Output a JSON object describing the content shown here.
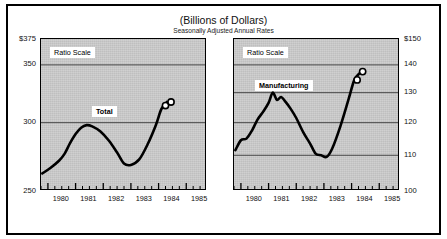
{
  "figure": {
    "title": "(Billions of Dollars)",
    "subtitle": "Seasonally Adjusted Annual Rates"
  },
  "chart_data": [
    {
      "type": "line",
      "panel": "left",
      "title": "Total",
      "series_label": "Total",
      "scale_note": "Ratio Scale",
      "xlabel": "",
      "ylabel": "",
      "yaxis_side": "left",
      "ylim": [
        250,
        375
      ],
      "ytick_labels": [
        "$375",
        "350",
        "300",
        "250"
      ],
      "ytick_values": [
        375,
        350,
        300,
        250
      ],
      "grid": true,
      "xlim": [
        1979.75,
        1985.75
      ],
      "xtick_labels": [
        "1980",
        "1981",
        "1982",
        "1983",
        "1984",
        "1985"
      ],
      "xtick_values": [
        1980,
        1981,
        1982,
        1983,
        1984,
        1985
      ],
      "minor_ticks_per_year": 4,
      "x": [
        1979.8,
        1980.1,
        1980.4,
        1980.6,
        1980.8,
        1981.0,
        1981.2,
        1981.4,
        1981.6,
        1981.9,
        1982.2,
        1982.5,
        1982.75,
        1983.0,
        1983.3,
        1983.6,
        1983.9,
        1984.1,
        1984.3
      ],
      "values": [
        262,
        266,
        271,
        276,
        284,
        291,
        296,
        298,
        297,
        293,
        286,
        277,
        269,
        268,
        272,
        283,
        298,
        311,
        317
      ],
      "endpoint_markers": [
        {
          "x": 1984.25,
          "y": 314,
          "style": "open-circle"
        },
        {
          "x": 1984.45,
          "y": 317,
          "style": "open-circle"
        }
      ]
    },
    {
      "type": "line",
      "panel": "right",
      "title": "Manufacturing",
      "series_label": "Manufacturing",
      "scale_note": "Ratio Scale",
      "xlabel": "",
      "ylabel": "",
      "yaxis_side": "right",
      "ylim": [
        100,
        150
      ],
      "ytick_labels": [
        "$150",
        "140",
        "130",
        "120",
        "110",
        "100"
      ],
      "ytick_values": [
        150,
        140,
        130,
        120,
        110,
        100
      ],
      "grid": true,
      "xlim": [
        1979.75,
        1985.75
      ],
      "xtick_labels": [
        "1980",
        "1981",
        "1982",
        "1983",
        "1984",
        "1985"
      ],
      "xtick_values": [
        1980,
        1981,
        1982,
        1983,
        1984,
        1985
      ],
      "minor_ticks_per_year": 4,
      "x": [
        1979.8,
        1980.0,
        1980.2,
        1980.4,
        1980.6,
        1980.8,
        1981.0,
        1981.15,
        1981.3,
        1981.45,
        1981.6,
        1981.8,
        1982.0,
        1982.25,
        1982.5,
        1982.7,
        1982.9,
        1983.1,
        1983.3,
        1983.6,
        1983.9,
        1984.1,
        1984.3
      ],
      "values": [
        111.5,
        114.5,
        115.0,
        117.5,
        121.0,
        123.5,
        126.5,
        130.0,
        127.5,
        128.5,
        127.0,
        124.5,
        121.5,
        117.0,
        113.5,
        110.5,
        110.0,
        109.5,
        112.0,
        119.0,
        128.0,
        134.5,
        137.0
      ],
      "endpoint_markers": [
        {
          "x": 1984.2,
          "y": 134.5,
          "style": "open-circle"
        },
        {
          "x": 1984.4,
          "y": 137.5,
          "style": "open-circle"
        }
      ]
    }
  ]
}
